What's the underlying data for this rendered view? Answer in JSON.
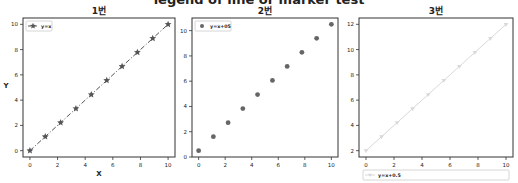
{
  "figure": {
    "suptitle": "legend of line or marker test"
  },
  "chart_data": [
    {
      "type": "line",
      "title": "1번",
      "xlabel": "X",
      "ylabel": "Y",
      "xlim": [
        -0.5,
        10.5
      ],
      "ylim": [
        -0.5,
        10.5
      ],
      "xticks": [
        0,
        2,
        4,
        6,
        8,
        10
      ],
      "yticks": [
        0,
        2,
        4,
        6,
        8,
        10
      ],
      "grid": false,
      "legend_position": "upper left",
      "series": [
        {
          "name": "y=x",
          "x": [
            0,
            1.11,
            2.22,
            3.33,
            4.44,
            5.56,
            6.67,
            7.78,
            8.89,
            10
          ],
          "y": [
            0,
            1.11,
            2.22,
            3.33,
            4.44,
            5.56,
            6.67,
            7.78,
            8.89,
            10
          ],
          "line_style": "dashdot",
          "marker": "star",
          "color": "#555555"
        }
      ]
    },
    {
      "type": "scatter",
      "title": "2번",
      "xlabel": "",
      "ylabel": "",
      "xlim": [
        -0.5,
        10.5
      ],
      "ylim": [
        0,
        11
      ],
      "xticks": [
        0,
        2,
        4,
        6,
        8,
        10
      ],
      "yticks": [
        0,
        2,
        4,
        6,
        8,
        10
      ],
      "grid": false,
      "legend_position": "upper left",
      "series": [
        {
          "name": "y=x+05",
          "x": [
            0,
            1.11,
            2.22,
            3.33,
            4.44,
            5.56,
            6.67,
            7.78,
            8.89,
            10
          ],
          "y": [
            0.5,
            1.61,
            2.72,
            3.83,
            4.94,
            6.06,
            7.17,
            8.28,
            9.39,
            10.5
          ],
          "line_style": "none",
          "marker": "circle",
          "color": "#666666"
        }
      ]
    },
    {
      "type": "line",
      "title": "3번",
      "xlabel": "",
      "ylabel": "",
      "xlim": [
        -0.5,
        10.5
      ],
      "ylim": [
        1.5,
        12.5
      ],
      "xticks": [
        0,
        2,
        4,
        6,
        8,
        10
      ],
      "yticks": [
        2,
        4,
        6,
        8,
        10,
        12
      ],
      "grid": false,
      "legend_position": "below axes (lower center)",
      "series": [
        {
          "name": "y=x+0.5",
          "x": [
            0,
            1.11,
            2.22,
            3.33,
            4.44,
            5.56,
            6.67,
            7.78,
            8.89,
            10
          ],
          "y": [
            2,
            3.11,
            4.22,
            5.33,
            6.44,
            7.56,
            8.67,
            9.78,
            10.89,
            12
          ],
          "line_style": "solid",
          "marker": "triangle-down",
          "color": "#d9d9d9"
        }
      ]
    }
  ]
}
